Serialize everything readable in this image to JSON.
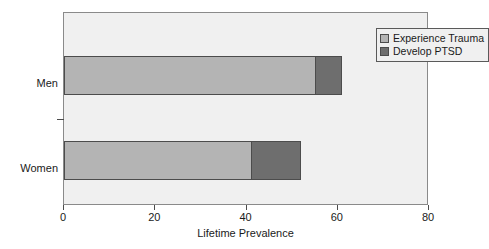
{
  "chart_data": {
    "type": "bar",
    "orientation": "horizontal",
    "stacked": true,
    "title": "",
    "xlabel": "Lifetime Prevalence",
    "ylabel": "",
    "categories": [
      "Men",
      "Women"
    ],
    "series": [
      {
        "name": "Experience Trauma",
        "color": "#b4b4b4",
        "values": [
          55,
          41
        ]
      },
      {
        "name": "Develop PTSD",
        "color": "#6e6e6e",
        "values": [
          6,
          11
        ]
      }
    ],
    "totals": [
      61,
      52
    ],
    "xlim": [
      0,
      80
    ],
    "xticks": [
      0,
      20,
      40,
      60,
      80
    ],
    "xtick_labels": [
      "0",
      "20",
      "40",
      "60",
      "80"
    ],
    "grid": false,
    "legend_position": "top-right",
    "plot_background": "#f0f0f0",
    "frame_color": "#8a8a8a"
  },
  "axis": {
    "x_title": "Lifetime Prevalence",
    "tick_0": "0",
    "tick_1": "20",
    "tick_2": "40",
    "tick_3": "60",
    "tick_4": "80"
  },
  "categories": {
    "men": "Men",
    "women": "Women"
  },
  "legend": {
    "item_0": "Experience Trauma",
    "item_1": "Develop PTSD"
  }
}
